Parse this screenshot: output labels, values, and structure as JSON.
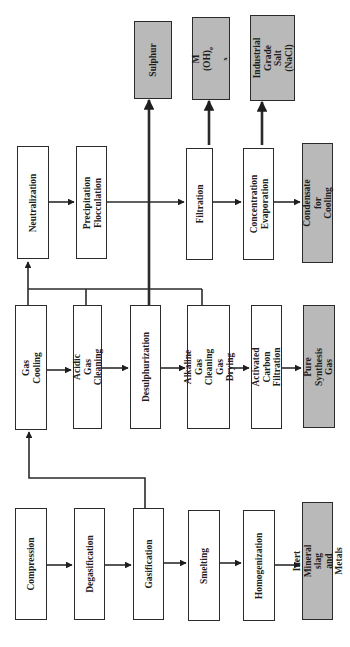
{
  "diagram": {
    "orientation": "rotated-90-ccw",
    "colors": {
      "process_box": "#ffffff",
      "output_box": "#b9b9b9",
      "line": "#2b2b2b"
    },
    "rows": {
      "raw_processing": [
        {
          "id": "compression",
          "label": "Compression",
          "type": "process"
        },
        {
          "id": "degasification",
          "label": "Degasification",
          "type": "process"
        },
        {
          "id": "gasification",
          "label": "Gasification",
          "type": "process"
        },
        {
          "id": "smelting",
          "label": "Smelting",
          "type": "process"
        },
        {
          "id": "homogenization",
          "label": "Homogenization",
          "type": "process"
        },
        {
          "id": "inert_mineral",
          "label": "Inert Mineral slag\nand Metals",
          "type": "output"
        }
      ],
      "gas_cleaning": [
        {
          "id": "gas_cooling",
          "label": "Gas Cooling",
          "type": "process"
        },
        {
          "id": "acidic_gas",
          "label": "Acidic Gas\nCleaning",
          "type": "process"
        },
        {
          "id": "desulphurization",
          "label": "Desulphurization",
          "type": "process"
        },
        {
          "id": "alkaline_gas",
          "label": "Alkaline Gas\nCleaning Gas\nDrying",
          "type": "process"
        },
        {
          "id": "activated_carbon",
          "label": "Activated Carbon\nFiltration",
          "type": "process"
        },
        {
          "id": "pure_syngas",
          "label": "Pure Synthesis Gas",
          "type": "output"
        }
      ],
      "water_treatment": [
        {
          "id": "neutralization",
          "label": "Neutralization",
          "type": "process"
        },
        {
          "id": "precipitation",
          "label": "Precipitation\nFlocculation",
          "type": "process"
        },
        {
          "id": "filtration",
          "label": "Filtration",
          "type": "process"
        },
        {
          "id": "concentration",
          "label": "Concentration\nEvaporation",
          "type": "process"
        },
        {
          "id": "condensate",
          "label": "Condensate for\nCooling",
          "type": "output"
        }
      ],
      "byproducts": [
        {
          "id": "sulphur",
          "label": "Sulphur",
          "type": "output"
        },
        {
          "id": "metal_hydroxide",
          "label": "M (OH)",
          "sub_e": "e",
          "sub_x": "x",
          "type": "output"
        },
        {
          "id": "industrial_salt",
          "label": "Industrial\nGrade Salt\n(NaCl)",
          "type": "output"
        }
      ]
    }
  }
}
